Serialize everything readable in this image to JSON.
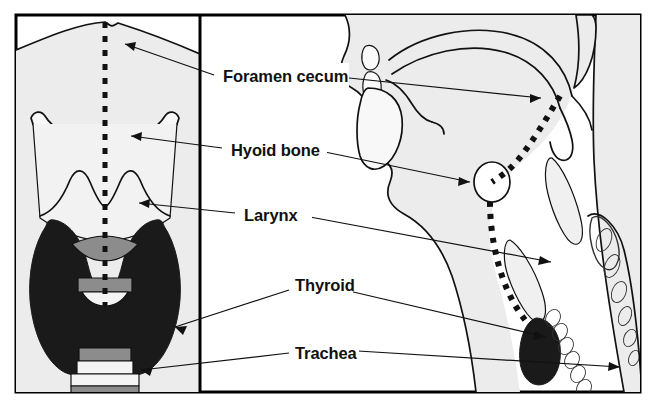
{
  "figure": {
    "panels": [
      {
        "id": "left",
        "name": "anterior-view",
        "caption": ""
      },
      {
        "id": "right",
        "name": "midsagittal-view",
        "caption": ""
      }
    ]
  },
  "labels": [
    {
      "id": "foramen_cecum",
      "text": "Foramen cecum"
    },
    {
      "id": "hyoid_bone",
      "text": "Hyoid bone"
    },
    {
      "id": "larynx",
      "text": "Larynx"
    },
    {
      "id": "thyroid",
      "text": "Thyroid"
    },
    {
      "id": "trachea",
      "text": "Trachea"
    }
  ],
  "colors": {
    "background": "#ffffff",
    "panel_fill": "#ececec",
    "outline": "#111111",
    "thyroid_dark": "#1a1a1a",
    "cartilage_light": "#f5f5f5",
    "cartilage_mid": "#8c8c8c",
    "tract_dotted": "#111111",
    "border": "#000000"
  },
  "structures": {
    "left_panel": [
      {
        "name": "thyroid-cartilage",
        "fill": "#f3f3f3"
      },
      {
        "name": "hyoid-bone",
        "fill": "#f7f7f7"
      },
      {
        "name": "thyroid-gland-lobes",
        "fill": "#1a1a1a"
      },
      {
        "name": "thyroid-isthmus",
        "fill": "#8c8c8c"
      },
      {
        "name": "trachea-rings",
        "fill": "#8c8c8c"
      },
      {
        "name": "midline-dotted-tract",
        "fill": "#111111"
      }
    ],
    "right_panel": [
      {
        "name": "head-neck-profile",
        "fill": "#ececec"
      },
      {
        "name": "tongue",
        "fill": "#f7f7f7"
      },
      {
        "name": "hard-palate",
        "fill": "#ffffff"
      },
      {
        "name": "mandible",
        "fill": "#f5f5f5"
      },
      {
        "name": "hyoid-bone-oval",
        "fill": "#ffffff"
      },
      {
        "name": "thyroglossal-duct-dotted-tract",
        "fill": "#111111"
      },
      {
        "name": "larynx-cartilage",
        "fill": "#efefef"
      },
      {
        "name": "thyroid-gland",
        "fill": "#1a1a1a"
      },
      {
        "name": "tracheal-rings",
        "fill": "#efefef"
      },
      {
        "name": "vertebral-column",
        "fill": "#efefef"
      }
    ]
  },
  "annotations": {
    "arrow_count": 8,
    "arrow_style": "thin solid line with filled triangular head"
  }
}
